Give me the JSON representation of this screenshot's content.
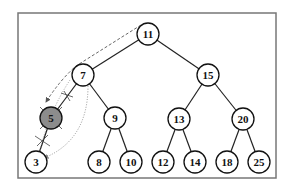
{
  "diagram": {
    "type": "binary-search-tree",
    "frame": {
      "x": 18,
      "y": 13,
      "width": 258,
      "height": 165,
      "color": "#777777"
    },
    "colors": {
      "node_stroke": "#111111",
      "node_fill": "#ffffff",
      "highlight_fill": "#8c8c8c",
      "edge": "#222222",
      "dashed_arrow": "#555555",
      "dotted_arrow": "#888888"
    },
    "node_radius": 11,
    "nodes": [
      {
        "id": "n11",
        "label": "11",
        "x": 148,
        "y": 34,
        "highlighted": false
      },
      {
        "id": "n7",
        "label": "7",
        "x": 83,
        "y": 75,
        "highlighted": false
      },
      {
        "id": "n15",
        "label": "15",
        "x": 208,
        "y": 75,
        "highlighted": false
      },
      {
        "id": "n5",
        "label": "5",
        "x": 51,
        "y": 118,
        "highlighted": true
      },
      {
        "id": "n9",
        "label": "9",
        "x": 115,
        "y": 118,
        "highlighted": false
      },
      {
        "id": "n13",
        "label": "13",
        "x": 179,
        "y": 119,
        "highlighted": false
      },
      {
        "id": "n20",
        "label": "20",
        "x": 243,
        "y": 119,
        "highlighted": false
      },
      {
        "id": "n3",
        "label": "3",
        "x": 36,
        "y": 162,
        "highlighted": false
      },
      {
        "id": "n8",
        "label": "8",
        "x": 99,
        "y": 162,
        "highlighted": false
      },
      {
        "id": "n10",
        "label": "10",
        "x": 131,
        "y": 162,
        "highlighted": false
      },
      {
        "id": "n12",
        "label": "12",
        "x": 163,
        "y": 162,
        "highlighted": false
      },
      {
        "id": "n14",
        "label": "14",
        "x": 195,
        "y": 162,
        "highlighted": false
      },
      {
        "id": "n18",
        "label": "18",
        "x": 227,
        "y": 162,
        "highlighted": false
      },
      {
        "id": "n25",
        "label": "25",
        "x": 259,
        "y": 162,
        "highlighted": false
      }
    ],
    "edges": [
      {
        "from": "n11",
        "to": "n7"
      },
      {
        "from": "n11",
        "to": "n15"
      },
      {
        "from": "n7",
        "to": "n5",
        "crossed": true
      },
      {
        "from": "n7",
        "to": "n9"
      },
      {
        "from": "n15",
        "to": "n13"
      },
      {
        "from": "n15",
        "to": "n20"
      },
      {
        "from": "n5",
        "to": "n3",
        "crossed": true
      },
      {
        "from": "n9",
        "to": "n8"
      },
      {
        "from": "n9",
        "to": "n10"
      },
      {
        "from": "n13",
        "to": "n12"
      },
      {
        "from": "n13",
        "to": "n14"
      },
      {
        "from": "n20",
        "to": "n18"
      },
      {
        "from": "n20",
        "to": "n25"
      }
    ],
    "annotations": [
      {
        "type": "dashed-arrow",
        "path": "11 -> 7 -> 5",
        "meaning": "search path"
      },
      {
        "type": "dotted-arrow",
        "path": "7 -> 3",
        "meaning": "relink"
      },
      {
        "type": "cross-marks",
        "on": "node 5 and its edges",
        "meaning": "deleted node"
      }
    ]
  }
}
